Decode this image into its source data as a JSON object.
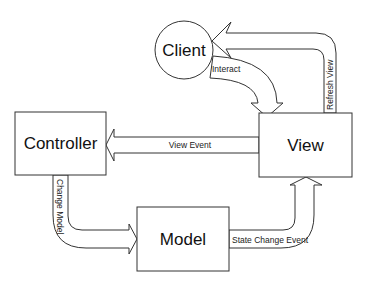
{
  "diagram": {
    "title": "",
    "nodes": {
      "client": {
        "label": "Client",
        "shape": "circle"
      },
      "controller": {
        "label": "Controller",
        "shape": "rectangle"
      },
      "view": {
        "label": "View",
        "shape": "rectangle"
      },
      "model": {
        "label": "Model",
        "shape": "rectangle"
      }
    },
    "edges": {
      "interact": {
        "label": "Interact",
        "from": "Client",
        "to": "View"
      },
      "refresh_view": {
        "label": "Refresh View",
        "from": "View",
        "to": "Client"
      },
      "view_event": {
        "label": "View Event",
        "from": "View",
        "to": "Controller"
      },
      "change_model": {
        "label": "Change Model",
        "from": "Controller",
        "to": "Model"
      },
      "state_change_event": {
        "label": "State Change Event",
        "from": "Model",
        "to": "View"
      }
    },
    "colors": {
      "stroke": "#333333",
      "fill": "#ffffff",
      "text": "#111111"
    }
  }
}
